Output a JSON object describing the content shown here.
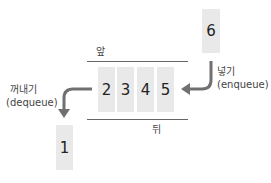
{
  "diagram": {
    "title": "Queue",
    "front_label": "앞",
    "rear_label": "뒤",
    "queue_items": [
      "2",
      "3",
      "4",
      "5"
    ],
    "incoming_item": "6",
    "outgoing_item": "1",
    "enqueue": {
      "label_ko": "넣기",
      "label_en": "(enqueue)"
    },
    "dequeue": {
      "label_ko": "꺼내기",
      "label_en": "(dequeue)"
    },
    "colors": {
      "box": "#e9e9e9",
      "arrow": "#707070",
      "line": "#666666"
    }
  }
}
